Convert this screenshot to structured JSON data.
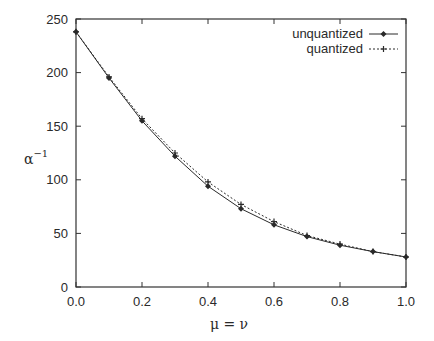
{
  "chart_data": {
    "type": "line",
    "title": "",
    "xlabel": "μ = ν",
    "ylabel": "α",
    "ylabel_superscript": "−1",
    "x": [
      0.0,
      0.1,
      0.2,
      0.3,
      0.4,
      0.5,
      0.6,
      0.7,
      0.8,
      0.9,
      1.0
    ],
    "series": [
      {
        "name": "unquantized",
        "style": "solid",
        "marker": "diamond",
        "values": [
          238,
          195,
          155,
          122,
          94,
          73,
          58,
          47,
          39,
          33,
          28
        ]
      },
      {
        "name": "quantized",
        "style": "dashed",
        "marker": "plus",
        "values": [
          238,
          196,
          157,
          125,
          98,
          77,
          61,
          48,
          40,
          33,
          28
        ]
      }
    ],
    "xlim": [
      0.0,
      1.0
    ],
    "ylim": [
      0,
      250
    ],
    "xticks": [
      "0.0",
      "0.2",
      "0.4",
      "0.6",
      "0.8",
      "1.0"
    ],
    "yticks": [
      "0",
      "50",
      "100",
      "150",
      "200",
      "250"
    ],
    "grid": false,
    "legend_position": "top-right"
  },
  "colors": {
    "line": "#2a2a2a",
    "axis": "#333333",
    "background": "#ffffff"
  }
}
